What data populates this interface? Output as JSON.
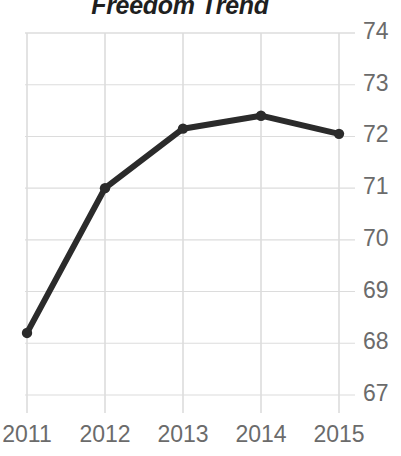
{
  "chart_data": {
    "type": "line",
    "title": "Freedom Trend",
    "xlabel": "",
    "ylabel": "",
    "categories": [
      "2011",
      "2012",
      "2013",
      "2014",
      "2015"
    ],
    "x": [
      2011,
      2012,
      2013,
      2014,
      2015
    ],
    "values": [
      68.2,
      71.0,
      72.15,
      72.4,
      72.05
    ],
    "series": [
      {
        "name": "Freedom Score",
        "values": [
          68.2,
          71.0,
          72.15,
          72.4,
          72.05
        ]
      }
    ],
    "ylim": [
      67,
      74
    ],
    "yticks": [
      67,
      68,
      69,
      70,
      71,
      72,
      73,
      74
    ],
    "ytick_labels": [
      "67",
      "68",
      "69",
      "70",
      "71",
      "72",
      "73",
      "74"
    ],
    "xtick_labels": [
      "2011",
      "2012",
      "2013",
      "2014",
      "2015"
    ],
    "grid": true,
    "grid_axis": "both",
    "legend": false,
    "legend_position": "none",
    "y_axis_side": "right",
    "marker": "circle",
    "colors": {
      "line": "#2b2b2b",
      "marker": "#2b2b2b",
      "grid": "#dcdcdc",
      "tick_label": "#6b6b6b",
      "title": "#1f1f1f",
      "background": "#ffffff"
    }
  }
}
